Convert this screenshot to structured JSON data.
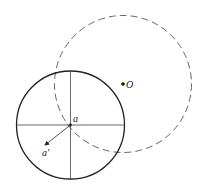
{
  "diagram": {
    "solid_circle": {
      "cx": 70.5,
      "cy": 125,
      "r": 54,
      "stroke": "#222222"
    },
    "dashed_circle": {
      "cx": 123,
      "cy": 84,
      "r": 68.5,
      "stroke": "#555555"
    },
    "labels": {
      "a": "a",
      "a_prime": "a'",
      "O": "O"
    },
    "points": {
      "a": {
        "x": 70.5,
        "y": 125
      },
      "a_prime": {
        "x": 44,
        "y": 146
      },
      "O": {
        "x": 123,
        "y": 84
      }
    }
  }
}
